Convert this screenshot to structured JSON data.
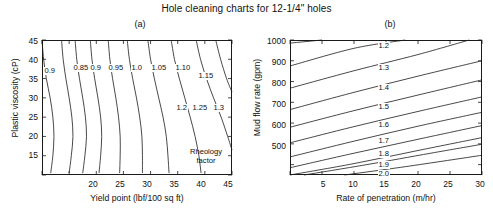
{
  "figure": {
    "title": "Hole cleaning charts for 12-1/4\" holes"
  },
  "panel_a": {
    "label": "(a)",
    "xlabel": "Yield point (lbf/100 sq ft)",
    "ylabel": "Plastic viscosity (cP)",
    "xticks": [
      "20",
      "25",
      "30",
      "35",
      "40",
      "45"
    ],
    "yticks": [
      "45",
      "40",
      "35",
      "30",
      "25",
      "20",
      "15"
    ],
    "annotation_line1": "Rheology",
    "annotation_line2": "factor",
    "contour_labels": [
      "0.9",
      "0.85",
      "0.9",
      "0.95",
      "1.0",
      "1.05",
      "1.10",
      "1.15",
      "1.2",
      "1.25",
      "1.3"
    ]
  },
  "panel_b": {
    "label": "(b)",
    "xlabel": "Rate of penetration (m/hr)",
    "ylabel": "Mud flow rate (gpm)",
    "xticks": [
      "5",
      "10",
      "15",
      "20",
      "25",
      "30"
    ],
    "yticks": [
      "1000",
      "900",
      "800",
      "700",
      "600",
      "500"
    ],
    "contour_labels": [
      "1.2",
      "1.3",
      "1.4",
      "1.5",
      "1.6",
      "1.7",
      "1.8",
      "1.9",
      "2.0"
    ]
  },
  "chart_data": [
    {
      "type": "line",
      "subtype": "contour",
      "title": "Hole cleaning charts for 12-1/4\" holes",
      "panel": "(a)",
      "xlabel": "Yield point (lbf/100 sq ft)",
      "ylabel": "Plastic viscosity (cP)",
      "xlim": [
        10,
        45
      ],
      "ylim": [
        10,
        45
      ],
      "xticks": [
        20,
        25,
        30,
        35,
        40,
        45
      ],
      "yticks": [
        15,
        20,
        25,
        30,
        35,
        40,
        45
      ],
      "grid": false,
      "legend": "none",
      "annotations": [
        {
          "text": "Rheology factor",
          "x": 39.5,
          "y": 14.5
        }
      ],
      "series": [
        {
          "name": "0.9",
          "level": 0.9,
          "points": [
            [
              10.0,
              45.0
            ],
            [
              10.3,
              40.0
            ],
            [
              10.8,
              35.0
            ],
            [
              11.5,
              30.0
            ],
            [
              12.0,
              25.0
            ],
            [
              12.2,
              20.0
            ],
            [
              12.0,
              15.0
            ],
            [
              11.6,
              10.5
            ]
          ]
        },
        {
          "name": "0.85",
          "level": 0.85,
          "points": [
            [
              13.6,
              45.0
            ],
            [
              13.9,
              40.0
            ],
            [
              14.4,
              35.0
            ],
            [
              15.0,
              30.0
            ],
            [
              15.5,
              25.0
            ],
            [
              15.7,
              20.0
            ],
            [
              15.4,
              15.0
            ],
            [
              15.0,
              10.5
            ]
          ]
        },
        {
          "name": "0.9b",
          "level": 0.9,
          "points": [
            [
              16.1,
              45.0
            ],
            [
              16.4,
              40.0
            ],
            [
              16.9,
              35.0
            ],
            [
              17.5,
              30.0
            ],
            [
              18.0,
              25.0
            ],
            [
              18.2,
              20.0
            ],
            [
              17.9,
              15.0
            ],
            [
              17.5,
              10.5
            ]
          ]
        },
        {
          "name": "0.95",
          "level": 0.95,
          "points": [
            [
              18.9,
              45.0
            ],
            [
              19.2,
              40.0
            ],
            [
              19.7,
              35.0
            ],
            [
              20.3,
              30.0
            ],
            [
              20.8,
              25.0
            ],
            [
              21.0,
              20.0
            ],
            [
              20.8,
              15.0
            ],
            [
              20.5,
              10.5
            ]
          ]
        },
        {
          "name": "1.0",
          "level": 1.0,
          "points": [
            [
              22.2,
              45.0
            ],
            [
              22.5,
              40.0
            ],
            [
              23.0,
              35.0
            ],
            [
              23.6,
              30.0
            ],
            [
              24.1,
              25.0
            ],
            [
              24.4,
              20.0
            ],
            [
              24.4,
              15.0
            ],
            [
              24.3,
              10.5
            ]
          ]
        },
        {
          "name": "1.05",
          "level": 1.05,
          "points": [
            [
              25.7,
              45.0
            ],
            [
              26.1,
              40.0
            ],
            [
              26.7,
              35.0
            ],
            [
              27.4,
              30.0
            ],
            [
              28.0,
              25.0
            ],
            [
              28.4,
              20.0
            ],
            [
              28.5,
              15.0
            ],
            [
              28.5,
              10.5
            ]
          ]
        },
        {
          "name": "1.10",
          "level": 1.1,
          "points": [
            [
              29.5,
              45.0
            ],
            [
              30.0,
              40.0
            ],
            [
              30.7,
              35.0
            ],
            [
              31.5,
              30.0
            ],
            [
              32.3,
              25.0
            ],
            [
              32.9,
              20.0
            ],
            [
              33.2,
              15.0
            ],
            [
              33.4,
              10.5
            ]
          ]
        },
        {
          "name": "1.15",
          "level": 1.15,
          "points": [
            [
              33.8,
              45.0
            ],
            [
              34.4,
              40.0
            ],
            [
              35.3,
              35.0
            ],
            [
              36.3,
              30.0
            ],
            [
              37.3,
              25.0
            ],
            [
              38.2,
              20.0
            ],
            [
              38.9,
              15.0
            ],
            [
              39.3,
              10.5
            ]
          ]
        },
        {
          "name": "1.2",
          "level": 1.2,
          "points": [
            [
              38.4,
              45.0
            ],
            [
              39.2,
              40.0
            ],
            [
              40.3,
              35.0
            ],
            [
              41.6,
              30.0
            ],
            [
              43.0,
              25.0
            ],
            [
              44.2,
              20.0
            ],
            [
              45.0,
              16.5
            ]
          ]
        },
        {
          "name": "1.25",
          "level": 1.25,
          "points": [
            [
              42.0,
              45.0
            ],
            [
              42.9,
              40.0
            ],
            [
              44.0,
              35.0
            ],
            [
              45.0,
              31.5
            ]
          ]
        },
        {
          "name": "1.3",
          "level": 1.3,
          "points": [
            [
              45.0,
              45.0
            ],
            [
              45.0,
              45.0
            ]
          ]
        }
      ]
    },
    {
      "type": "line",
      "subtype": "contour",
      "panel": "(b)",
      "xlabel": "Rate of penetration (m/hr)",
      "ylabel": "Mud flow rate (gpm)",
      "xlim": [
        0,
        30
      ],
      "ylim": [
        350,
        1000
      ],
      "xticks": [
        5,
        10,
        15,
        20,
        25,
        30
      ],
      "yticks": [
        500,
        600,
        700,
        800,
        900,
        1000
      ],
      "grid": false,
      "legend": "none",
      "series": [
        {
          "name": "1.2",
          "level": 1.2,
          "points": [
            [
              0,
              985
            ],
            [
              5,
              1000
            ]
          ]
        },
        {
          "name": "1.3",
          "level": 1.3,
          "points": [
            [
              0,
              875
            ],
            [
              10,
              960
            ],
            [
              18,
              1000
            ]
          ]
        },
        {
          "name": "1.4",
          "level": 1.4,
          "points": [
            [
              0,
              768
            ],
            [
              10,
              852
            ],
            [
              20,
              930
            ],
            [
              28,
              1000
            ]
          ]
        },
        {
          "name": "1.5",
          "level": 1.5,
          "points": [
            [
              0,
              665
            ],
            [
              10,
              748
            ],
            [
              20,
              826
            ],
            [
              30,
              900
            ]
          ]
        },
        {
          "name": "1.6",
          "level": 1.6,
          "points": [
            [
              0,
              580
            ],
            [
              10,
              660
            ],
            [
              20,
              735
            ],
            [
              30,
              808
            ]
          ]
        },
        {
          "name": "1.7",
          "level": 1.7,
          "points": [
            [
              0,
              505
            ],
            [
              10,
              583
            ],
            [
              20,
              656
            ],
            [
              30,
              726
            ]
          ]
        },
        {
          "name": "1.8",
          "level": 1.8,
          "points": [
            [
              0,
              437
            ],
            [
              10,
              513
            ],
            [
              20,
              585
            ],
            [
              30,
              652
            ]
          ]
        },
        {
          "name": "1.9",
          "level": 1.9,
          "points": [
            [
              0,
              385
            ],
            [
              10,
              455
            ],
            [
              20,
              522
            ],
            [
              30,
              588
            ]
          ]
        },
        {
          "name": "2.0",
          "level": 2.0,
          "points": [
            [
              0,
              350
            ],
            [
              10,
              405
            ],
            [
              20,
              468
            ],
            [
              30,
              530
            ]
          ]
        },
        {
          "name": "2.1",
          "level": 2.1,
          "points": [
            [
              2.2,
              350
            ],
            [
              12,
              400
            ],
            [
              22,
              455
            ],
            [
              30,
              498
            ]
          ]
        },
        {
          "name": "2.2",
          "level": 2.2,
          "points": [
            [
              8.5,
              350
            ],
            [
              18,
              390
            ],
            [
              30,
              445
            ]
          ]
        }
      ]
    }
  ]
}
